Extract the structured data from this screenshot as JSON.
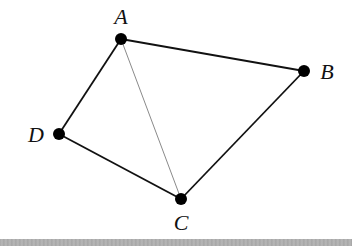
{
  "diagram": {
    "type": "graph",
    "vertices": [
      {
        "id": "A",
        "label": "A",
        "x": 121,
        "y": 39,
        "label_x": 121,
        "label_y": 24
      },
      {
        "id": "B",
        "label": "B",
        "x": 304,
        "y": 71,
        "label_x": 327,
        "label_y": 79
      },
      {
        "id": "C",
        "label": "C",
        "x": 181,
        "y": 199,
        "label_x": 181,
        "label_y": 230
      },
      {
        "id": "D",
        "label": "D",
        "x": 59,
        "y": 134,
        "label_x": 36,
        "label_y": 142
      }
    ],
    "edges": [
      {
        "from": "A",
        "to": "B",
        "style": "solid"
      },
      {
        "from": "B",
        "to": "C",
        "style": "solid"
      },
      {
        "from": "C",
        "to": "D",
        "style": "solid"
      },
      {
        "from": "D",
        "to": "A",
        "style": "solid"
      },
      {
        "from": "A",
        "to": "C",
        "style": "thin"
      }
    ],
    "colors": {
      "edge": "#111111",
      "thin_edge": "#8a8a8a",
      "vertex": "#000000",
      "bottom_band": "#aaaaaa"
    }
  }
}
